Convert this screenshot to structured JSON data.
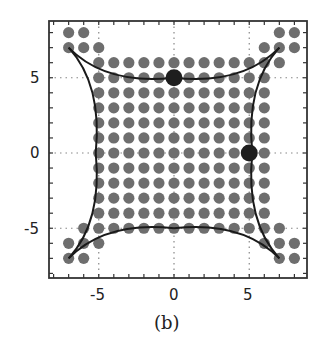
{
  "chart_data": {
    "type": "scatter",
    "title": "",
    "caption": "(b)",
    "xlabel": "",
    "ylabel": "",
    "xlim": [
      -8.3,
      8.9
    ],
    "ylim": [
      -8.3,
      8.8
    ],
    "grid": "dotted lines at -5, 0, 5",
    "x_ticks": [
      -5,
      0,
      5
    ],
    "x_tick_labels": [
      "-5",
      "0",
      "5"
    ],
    "y_ticks": [
      5,
      0,
      -5
    ],
    "y_tick_labels": [
      "5",
      "0",
      "-5"
    ],
    "minor_tick_step": 1,
    "lattice_rows": [
      {
        "y": 8,
        "x": [
          -7,
          -6,
          7,
          8
        ]
      },
      {
        "y": 7,
        "x": [
          -7,
          -6,
          -5,
          6,
          7,
          8
        ]
      },
      {
        "y": 6,
        "x_range": [
          -5,
          7
        ]
      },
      {
        "y": 5,
        "x_range": [
          -5,
          6
        ]
      },
      {
        "y": 4,
        "x_range": [
          -5,
          6
        ]
      },
      {
        "y": 3,
        "x_range": [
          -5,
          6
        ]
      },
      {
        "y": 2,
        "x_range": [
          -5,
          6
        ]
      },
      {
        "y": 1,
        "x_range": [
          -5,
          6
        ]
      },
      {
        "y": 0,
        "x_range": [
          -5,
          6
        ]
      },
      {
        "y": -1,
        "x_range": [
          -5,
          6
        ]
      },
      {
        "y": -2,
        "x_range": [
          -5,
          6
        ]
      },
      {
        "y": -3,
        "x_range": [
          -5,
          6
        ]
      },
      {
        "y": -4,
        "x_range": [
          -5,
          6
        ]
      },
      {
        "y": -5,
        "x_range": [
          -6,
          7
        ]
      },
      {
        "y": -6,
        "x": [
          -7,
          -6,
          -5,
          6,
          7,
          8
        ]
      },
      {
        "y": -7,
        "x": [
          -7,
          -6,
          7,
          8
        ]
      }
    ],
    "highlighted_points": [
      {
        "x": 0,
        "y": 5
      },
      {
        "x": 5,
        "y": 0
      }
    ],
    "curves": {
      "description": "Four concave arcs forming a curved square (astroid-like boundary)",
      "vertices": [
        [
          -7,
          7
        ],
        [
          7,
          7
        ],
        [
          7,
          -7
        ],
        [
          -7,
          -7
        ]
      ],
      "edge_midpoints": [
        [
          0,
          5
        ],
        [
          5.2,
          0
        ],
        [
          0,
          -5
        ],
        [
          -5.2,
          0
        ]
      ]
    },
    "colors": {
      "dot": "#6e6e6e",
      "highlight_dot": "#1e1e1e",
      "curve": "#1a1a1a",
      "frame": "#333333",
      "grid": "#888888"
    }
  }
}
